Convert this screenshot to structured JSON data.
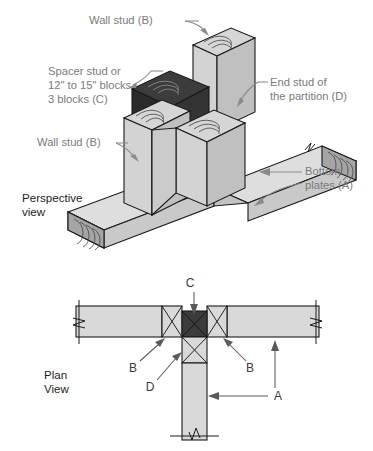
{
  "figure": {
    "views": [
      {
        "key": "perspective",
        "label_line1": "Perspective",
        "label_line2": "view"
      },
      {
        "key": "plan",
        "label_line1": "Plan",
        "label_line2": "View"
      }
    ]
  },
  "perspective": {
    "labels": [
      {
        "id": "wall-stud-top",
        "lines": [
          "Wall stud (B)"
        ],
        "code": "B"
      },
      {
        "id": "spacer-stud",
        "lines": [
          "Spacer stud or",
          "12\" to 15\" blocks",
          "3 blocks (C)"
        ],
        "code": "C"
      },
      {
        "id": "end-stud-partition",
        "lines": [
          "End stud of",
          "the partition (D)"
        ],
        "code": "D"
      },
      {
        "id": "wall-stud-left",
        "lines": [
          "Wall stud (B)"
        ],
        "code": "B"
      },
      {
        "id": "bottom-plates",
        "lines": [
          "Bottom",
          "plates (A)"
        ],
        "code": "A"
      }
    ],
    "view_label": {
      "line1": "Perspective",
      "line2": "view"
    }
  },
  "plan": {
    "view_label": {
      "line1": "Plan",
      "line2": "View"
    },
    "callouts": [
      {
        "id": "callout-c",
        "text": "C",
        "meaning": "spacer stud or blocks"
      },
      {
        "id": "callout-b-left",
        "text": "B",
        "meaning": "wall stud"
      },
      {
        "id": "callout-b-right",
        "text": "B",
        "meaning": "wall stud"
      },
      {
        "id": "callout-d",
        "text": "D",
        "meaning": "end stud of the partition"
      },
      {
        "id": "callout-a",
        "text": "A",
        "meaning": "bottom plate"
      }
    ]
  },
  "legend_keys": [
    {
      "code": "A",
      "name": "Bottom plates"
    },
    {
      "code": "B",
      "name": "Wall stud"
    },
    {
      "code": "C",
      "name": "Spacer stud or 12\" to 15\" blocks, 3 blocks"
    },
    {
      "code": "D",
      "name": "End stud of the partition"
    }
  ],
  "colors": {
    "lumber_light": "#dedede",
    "lumber_mid": "#c8c8c8",
    "lumber_shadow": "#b4b4b4",
    "lumber_dark_end": "#9a9a9a",
    "spacer_top": "#3c3c3c",
    "spacer_front": "#2b2b2b",
    "spacer_side": "#343434",
    "outline": "#1a1a1a",
    "label_gray": "#7a7a7a",
    "label_black": "#1d1d1d",
    "background": "#ffffff"
  }
}
